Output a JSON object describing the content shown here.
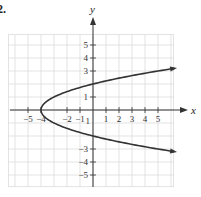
{
  "problem_number": "2.",
  "chart_data": {
    "type": "line",
    "title": "",
    "xlabel": "x",
    "ylabel": "y",
    "equation_implied": "x = y^2 - 4",
    "xlim": [
      -6.5,
      6.2
    ],
    "ylim": [
      -5.9,
      5.8
    ],
    "grid": true,
    "x_ticks": [
      -5,
      -4,
      -2,
      -1,
      1,
      2,
      3,
      4,
      5
    ],
    "x_tick_labels": [
      "−5",
      "−4",
      "−2",
      "−1",
      "1",
      "2",
      "3",
      "4",
      "5"
    ],
    "y_ticks": [
      5,
      4,
      3,
      1,
      -3,
      -4,
      -5
    ],
    "y_tick_labels": [
      "5",
      "4",
      "3",
      "1",
      "−3",
      "−4",
      "−5"
    ],
    "vertex": [
      -4,
      0
    ],
    "y_intercepts": [
      2,
      -2
    ],
    "series": [
      {
        "name": "parabola",
        "points": [
          [
            6.2,
            3.2
          ],
          [
            5,
            3
          ],
          [
            2.25,
            2.5
          ],
          [
            0,
            2
          ],
          [
            -1.75,
            1.5
          ],
          [
            -3,
            1
          ],
          [
            -3.75,
            0.5
          ],
          [
            -4,
            0
          ],
          [
            -3.75,
            -0.5
          ],
          [
            -3,
            -1
          ],
          [
            -1.75,
            -1.5
          ],
          [
            0,
            -2
          ],
          [
            2.25,
            -2.5
          ],
          [
            5,
            -3
          ],
          [
            6.2,
            -3.2
          ]
        ],
        "arrows": [
          "upper-end",
          "lower-end"
        ]
      }
    ]
  },
  "layout": {
    "origin_px": [
      93,
      110
    ],
    "unit_px": 13,
    "grid_color": "#dcdcdc",
    "axis_color": "#333333",
    "curve_color": "#333333"
  }
}
